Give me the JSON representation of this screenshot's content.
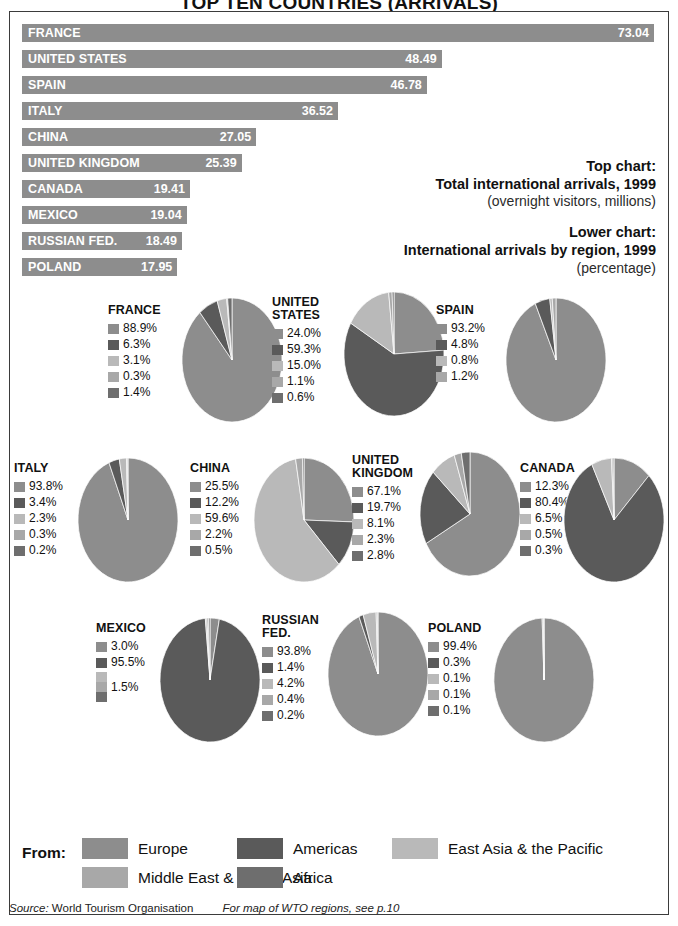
{
  "title": "TOP TEN COUNTRIES (ARRIVALS)",
  "captions": {
    "top_label": "Top chart:",
    "top_line": "Total international arrivals, 1999",
    "top_sub": "(overnight visitors, millions)",
    "lower_label": "Lower chart:",
    "lower_line": "International arrivals by region, 1999",
    "lower_sub": "(percentage)"
  },
  "legend": {
    "from_label": "From:",
    "items": [
      {
        "name": "Europe",
        "color": "#8d8d8d"
      },
      {
        "name": "Americas",
        "color": "#5a5a5a"
      },
      {
        "name": "East Asia & the Pacific",
        "color": "#b9b9b9"
      },
      {
        "name": "Middle East & South Asia",
        "color": "#a8a8a8"
      },
      {
        "name": "Africa",
        "color": "#6e6e6e"
      }
    ]
  },
  "source": {
    "label": "Source:",
    "value": "World Tourism Organisation",
    "note": "For map of WTO regions, see p.10"
  },
  "chart_data": [
    {
      "type": "bar",
      "title": "Total international arrivals, 1999",
      "subtitle": "(overnight visitors, millions)",
      "xlabel": "",
      "ylabel": "",
      "orientation": "horizontal",
      "xlim": [
        0,
        73.04
      ],
      "grid": false,
      "categories": [
        "FRANCE",
        "UNITED STATES",
        "SPAIN",
        "ITALY",
        "CHINA",
        "UNITED KINGDOM",
        "CANADA",
        "MEXICO",
        "RUSSIAN FED.",
        "POLAND"
      ],
      "values": [
        73.04,
        48.49,
        46.78,
        36.52,
        27.05,
        25.39,
        19.41,
        19.04,
        18.49,
        17.95
      ],
      "value_labels": [
        "73.04",
        "48.49",
        "46.78",
        "36.52",
        "27.05",
        "25.39",
        "19.41",
        "19.04",
        "18.49",
        "17.95"
      ],
      "bar_color": "#8d8d8d"
    },
    {
      "type": "pie",
      "title": "International arrivals by region, 1999",
      "subtitle": "(percentage)",
      "slice_labels": [
        "Europe",
        "Americas",
        "East Asia & the Pacific",
        "Middle East & South Asia",
        "Africa"
      ],
      "slice_colors": [
        "#8d8d8d",
        "#5a5a5a",
        "#b9b9b9",
        "#a8a8a8",
        "#6e6e6e"
      ],
      "pies": [
        {
          "name": "FRANCE",
          "values": [
            88.9,
            6.3,
            3.1,
            0.3,
            1.4
          ],
          "value_labels": [
            "88.9%",
            "6.3%",
            "3.1%",
            "0.3%",
            "1.4%"
          ]
        },
        {
          "name": "UNITED\nSTATES",
          "values": [
            24.0,
            59.3,
            15.0,
            1.1,
            0.6
          ],
          "value_labels": [
            "24.0%",
            "59.3%",
            "15.0%",
            "1.1%",
            "0.6%"
          ]
        },
        {
          "name": "SPAIN",
          "values": [
            93.2,
            4.8,
            0.8,
            1.2,
            0.0
          ],
          "value_labels": [
            "93.2%",
            "4.8%",
            "0.8%",
            "1.2%"
          ]
        },
        {
          "name": "ITALY",
          "values": [
            93.8,
            3.4,
            2.3,
            0.3,
            0.2
          ],
          "value_labels": [
            "93.8%",
            "3.4%",
            "2.3%",
            "0.3%",
            "0.2%"
          ]
        },
        {
          "name": "CHINA",
          "values": [
            25.5,
            12.2,
            59.6,
            2.2,
            0.5
          ],
          "value_labels": [
            "25.5%",
            "12.2%",
            "59.6%",
            "2.2%",
            "0.5%"
          ]
        },
        {
          "name": "UNITED\nKINGDOM",
          "values": [
            67.1,
            19.7,
            8.1,
            2.3,
            2.8
          ],
          "value_labels": [
            "67.1%",
            "19.7%",
            "8.1%",
            "2.3%",
            "2.8%"
          ]
        },
        {
          "name": "CANADA",
          "values": [
            12.3,
            80.4,
            6.5,
            0.5,
            0.3
          ],
          "value_labels": [
            "12.3%",
            "80.4%",
            "6.5%",
            "0.5%",
            "0.3%"
          ]
        },
        {
          "name": "MEXICO",
          "values": [
            3.0,
            95.5,
            0.5,
            0.5,
            0.5
          ],
          "value_labels": [
            "3.0%",
            "95.5%",
            "1.5%"
          ]
        },
        {
          "name": "RUSSIAN\nFED.",
          "values": [
            93.8,
            1.4,
            4.2,
            0.4,
            0.2
          ],
          "value_labels": [
            "93.8%",
            "1.4%",
            "4.2%",
            "0.4%",
            "0.2%"
          ]
        },
        {
          "name": "POLAND",
          "values": [
            99.4,
            0.3,
            0.1,
            0.1,
            0.1
          ],
          "value_labels": [
            "99.4%",
            "0.3%",
            "0.1%",
            "0.1%",
            "0.1%"
          ]
        }
      ]
    }
  ]
}
